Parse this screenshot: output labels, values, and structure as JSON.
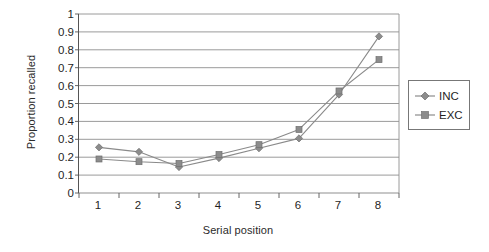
{
  "chart_data": {
    "type": "line",
    "title": "",
    "xlabel": "Serial position",
    "ylabel": "Proportion recalled",
    "categories": [
      1,
      2,
      3,
      4,
      5,
      6,
      7,
      8
    ],
    "x_tick_labels": [
      "1",
      "2",
      "3",
      "4",
      "5",
      "6",
      "7",
      "8"
    ],
    "y_tick_labels": [
      "1",
      "0.9",
      "0.8",
      "0.7",
      "0.6",
      "0.5",
      "0.4",
      "0.3",
      "0.2",
      "0.1",
      "0"
    ],
    "y_ticks": [
      1,
      0.9,
      0.8,
      0.7,
      0.6,
      0.5,
      0.4,
      0.3,
      0.2,
      0.1,
      0
    ],
    "ylim": [
      0,
      1
    ],
    "xlim": [
      0.5,
      8.5
    ],
    "grid": "horizontal",
    "legend_position": "right",
    "series": [
      {
        "name": "INC",
        "marker": "diamond",
        "color": "#8c8c8c",
        "line_color": "#8a8a8a",
        "values": [
          0.255,
          0.23,
          0.145,
          0.195,
          0.25,
          0.305,
          0.55,
          0.875
        ]
      },
      {
        "name": "EXC",
        "marker": "square",
        "color": "#8c8c8c",
        "line_color": "#8a8a8a",
        "values": [
          0.19,
          0.175,
          0.165,
          0.215,
          0.27,
          0.355,
          0.57,
          0.745
        ]
      }
    ]
  },
  "legend": {
    "entries": [
      {
        "label": "INC",
        "marker": "diamond"
      },
      {
        "label": "EXC",
        "marker": "square"
      }
    ]
  },
  "colors": {
    "axis": "#555555",
    "gridline": "#8f8f8f",
    "series": "#8c8c8c",
    "text": "#1f1f1f",
    "background": "#ffffff"
  }
}
